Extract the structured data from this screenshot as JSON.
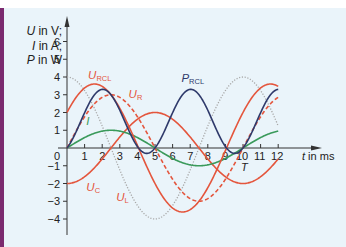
{
  "chart_data": {
    "type": "line",
    "title": "",
    "xlabel": "t in ms",
    "ylabel_lines": [
      "U in V;",
      "I in A;",
      "P in W"
    ],
    "xlim": [
      0,
      12
    ],
    "ylim": [
      -4,
      6
    ],
    "x_ticks": [
      1,
      2,
      3,
      4,
      5,
      6,
      7,
      8,
      9,
      10,
      11,
      12
    ],
    "y_ticks": [
      -4,
      -3,
      -2,
      -1,
      1,
      2,
      3,
      4,
      5,
      6
    ],
    "origin_label": "0",
    "period_marker": {
      "label": "T",
      "x": 10
    },
    "grid": false,
    "series": [
      {
        "name": "I",
        "label": "I",
        "style": "solid",
        "color": "#3a9a5b",
        "formula": "1*sin(2*pi*t/10)",
        "x": [
          0,
          2.5,
          5,
          7.5,
          10,
          12
        ],
        "values": [
          0,
          1,
          0,
          -1,
          0,
          0.95
        ]
      },
      {
        "name": "U_R",
        "label": "U",
        "sub": "R",
        "style": "dashed",
        "color": "#e4553c",
        "formula": "3*sin(2*pi*t/10)",
        "x": [
          0,
          2.5,
          5,
          7.5,
          10,
          12
        ],
        "values": [
          0,
          3,
          0,
          -3,
          0,
          2.85
        ]
      },
      {
        "name": "U_L",
        "label": "U",
        "sub": "L",
        "style": "dotted",
        "color": "#a8a8a8",
        "formula": "4*cos(2*pi*t/10)",
        "x": [
          0,
          2.5,
          5,
          7.5,
          10,
          12
        ],
        "values": [
          4,
          0,
          -4,
          0,
          4,
          1.24
        ]
      },
      {
        "name": "U_C",
        "label": "U",
        "sub": "C",
        "style": "solid",
        "color": "#e4553c",
        "formula": "-2*cos(2*pi*t/10)",
        "x": [
          0,
          2.5,
          5,
          7.5,
          10,
          12
        ],
        "values": [
          -2,
          0,
          2,
          0,
          -2,
          -0.62
        ]
      },
      {
        "name": "U_RCL",
        "label": "U",
        "sub": "RCL",
        "style": "solid",
        "color": "#e4553c",
        "formula": "3*sin(2*pi*t/10)+2*cos(2*pi*t/10)",
        "x": [
          0,
          1.57,
          4.07,
          6.57,
          9.07,
          12
        ],
        "values": [
          2,
          3.61,
          0,
          -3.61,
          0,
          3.47
        ]
      },
      {
        "name": "P_RCL",
        "label": "P",
        "sub": "RCL",
        "style": "solid",
        "color": "#2f3a6b",
        "formula": "(3*sin+2*cos)*sin",
        "x": [
          0,
          2.0,
          4.5,
          5,
          7,
          9.5,
          10,
          12
        ],
        "values": [
          0,
          3.2,
          -0.3,
          0,
          3.3,
          -0.3,
          0,
          3.2
        ]
      }
    ],
    "annotations": [
      {
        "text": "U",
        "sub": "RCL",
        "x": 1.2,
        "y": 3.9
      },
      {
        "text": "U",
        "sub": "R",
        "x": 3.5,
        "y": 2.8
      },
      {
        "text": "P",
        "sub": "RCL",
        "x": 6.5,
        "y": 3.7
      },
      {
        "text": "I",
        "sub": "",
        "x": 1.1,
        "y": 1.3
      },
      {
        "text": "U",
        "sub": "C",
        "x": 1.1,
        "y": -2.4
      },
      {
        "text": "U",
        "sub": "L",
        "x": 2.8,
        "y": -3.0
      }
    ]
  }
}
